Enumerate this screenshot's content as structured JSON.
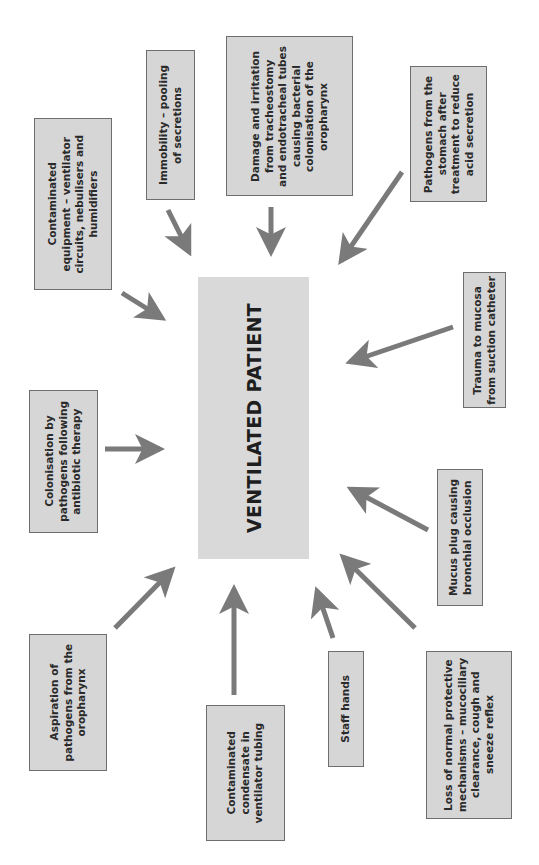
{
  "diagram": {
    "center": {
      "label": "VENTILATED PATIENT"
    },
    "causes": [
      {
        "id": "contaminated-equipment",
        "label": "Contaminated\nequipment – ventilator\ncircuits, nebulisers and\nhumidifiers"
      },
      {
        "id": "immobility",
        "label": "Immobility – pooling\nof secretions"
      },
      {
        "id": "damage-irritation",
        "label": "Damage and irritation\nfrom tracheostomy\nand endotracheal tubes\ncausing bacterial\ncolonisation of the\noropharynx"
      },
      {
        "id": "pathogens-stomach",
        "label": "Pathogens from the\nstomach after\ntreatment to reduce\nacid secretion"
      },
      {
        "id": "trauma-mucosa",
        "label": "Trauma to mucosa\nfrom suction catheter"
      },
      {
        "id": "mucus-plug",
        "label": "Mucus plug causing\nbronchial occlusion"
      },
      {
        "id": "loss-protective",
        "label": "Loss of normal protective\nmechanisms – mucociliary\nclearance, cough and\nsneeze reflex"
      },
      {
        "id": "staff-hands",
        "label": "Staff hands"
      },
      {
        "id": "contaminated-condensate",
        "label": "Contaminated\ncondensate in\nventilator tubing"
      },
      {
        "id": "aspiration",
        "label": "Aspiration of\npathogens from the\noropharynx"
      },
      {
        "id": "colonisation-antibiotic",
        "label": "Colonisation by\npathogens following\nantibiotic therapy"
      }
    ],
    "colors": {
      "box_fill": "#d6d6d6",
      "center_fill": "#d9d9d9",
      "arrow": "#7a7a7a",
      "border": "#6e6e6e"
    }
  }
}
